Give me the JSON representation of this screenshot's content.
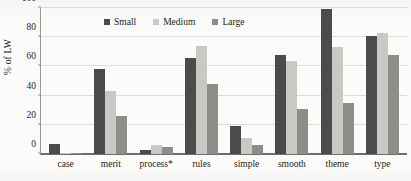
{
  "chart_data": {
    "type": "bar",
    "title": "",
    "subtitle": "",
    "xlabel": "",
    "ylabel": "% of LW",
    "ylim": [
      0,
      100
    ],
    "yticks": [
      0,
      20,
      40,
      60,
      80,
      100
    ],
    "ytick_labels": [
      "0",
      "20",
      "40",
      "60",
      "80",
      "100"
    ],
    "grid": "horizontal",
    "legend_position": "top-center",
    "categories": [
      "case",
      "merit",
      "process*",
      "rules",
      "simple",
      "smooth",
      "theme",
      "type"
    ],
    "series": [
      {
        "name": "Small",
        "color": "#4b4b4b",
        "values": [
          7,
          58,
          3,
          66,
          19,
          68,
          99,
          81
        ]
      },
      {
        "name": "Medium",
        "color": "#c8c8c4",
        "values": [
          1,
          43,
          6,
          74,
          11,
          64,
          73,
          83
        ]
      },
      {
        "name": "Large",
        "color": "#8d8d8a",
        "values": [
          1,
          26,
          5,
          48,
          6,
          31,
          35,
          68
        ]
      }
    ]
  },
  "legend": {
    "items": [
      {
        "label": "Small"
      },
      {
        "label": "Medium"
      },
      {
        "label": "Large"
      }
    ]
  },
  "axes": {
    "y_label": "% of LW"
  }
}
